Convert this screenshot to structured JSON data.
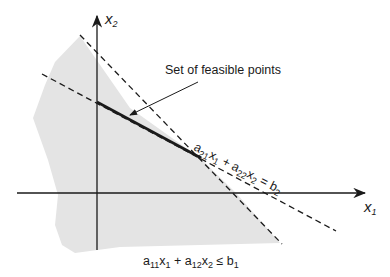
{
  "diagram": {
    "axes": {
      "x1_label": "x",
      "x1_sub": "1",
      "x2_label": "x",
      "x2_sub": "2"
    },
    "annotation": {
      "feasible_label": "Set of feasible points"
    },
    "constraints": {
      "equality": {
        "a": "a",
        "a_sub": "21",
        "x1": "x",
        "x1_sub": "1",
        "plus": " + ",
        "b": "a",
        "b_sub": "22",
        "x2": "x",
        "x2_sub": "2",
        "rel": " = ",
        "rhs": "b",
        "rhs_sub": "2"
      },
      "inequality": {
        "a": "a",
        "a_sub": "11",
        "x1": "x",
        "x1_sub": "1",
        "plus": " + ",
        "b": "a",
        "b_sub": "12",
        "x2": "x",
        "x2_sub": "2",
        "rel": " ≤ ",
        "rhs": "b",
        "rhs_sub": "1"
      }
    },
    "colors": {
      "shade": "#e4e4e4",
      "ink": "#1a1a1a"
    }
  }
}
